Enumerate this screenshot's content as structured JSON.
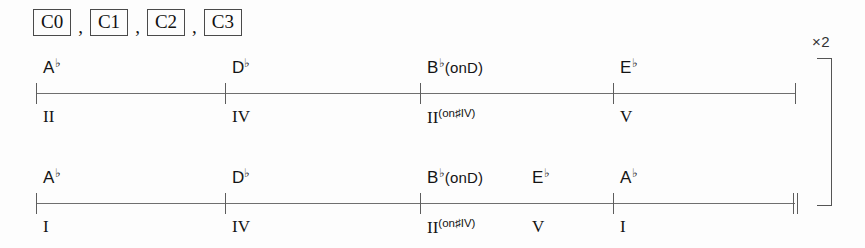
{
  "section_labels": {
    "separator": ",",
    "items": [
      "C0",
      "C1",
      "C2",
      "C3"
    ]
  },
  "repeat": {
    "count_label": "×2"
  },
  "chart_data": {
    "type": "table",
    "title": "",
    "key": "A♭ major",
    "sections": [
      "C0",
      "C1",
      "C2",
      "C3"
    ],
    "repeat_times": 2,
    "rows": [
      {
        "row_index": 1,
        "end_barline": "single",
        "events": [
          {
            "chord_root": "A",
            "chord_accidental": "♭",
            "chord_suffix": "",
            "chord_text": "A♭",
            "roman": "II",
            "roman_sup": "",
            "roman_text": "I",
            "x": 36,
            "tick": true
          },
          {
            "chord_root": "D",
            "chord_accidental": "♭",
            "chord_suffix": "",
            "chord_text": "D♭",
            "roman": "IV",
            "roman_sup": "",
            "roman_text": "IV",
            "x": 225,
            "tick": true
          },
          {
            "chord_root": "B",
            "chord_accidental": "♭",
            "chord_suffix": "(onD)",
            "chord_text": "B♭(onD)",
            "roman": "II",
            "roman_sup": "(on♯IV)",
            "roman_text": "II(on♯IV)",
            "x": 420,
            "tick": true
          },
          {
            "chord_root": "E",
            "chord_accidental": "♭",
            "chord_suffix": "",
            "chord_text": "E♭",
            "roman": "V",
            "roman_sup": "",
            "roman_text": "V",
            "x": 613,
            "tick": true
          }
        ]
      },
      {
        "row_index": 2,
        "end_barline": "double",
        "events": [
          {
            "chord_root": "A",
            "chord_accidental": "♭",
            "chord_suffix": "",
            "chord_text": "A♭",
            "roman": "I",
            "roman_sup": "",
            "roman_text": "I",
            "x": 36,
            "tick": true
          },
          {
            "chord_root": "D",
            "chord_accidental": "♭",
            "chord_suffix": "",
            "chord_text": "D♭",
            "roman": "IV",
            "roman_sup": "",
            "roman_text": "IV",
            "x": 225,
            "tick": true
          },
          {
            "chord_root": "B",
            "chord_accidental": "♭",
            "chord_suffix": "(onD)",
            "chord_text": "B♭(onD)",
            "roman": "II",
            "roman_sup": "(on♯IV)",
            "roman_text": "II(on♯IV)",
            "x": 420,
            "tick": true
          },
          {
            "chord_root": "E",
            "chord_accidental": "♭",
            "chord_suffix": "",
            "chord_text": "E♭",
            "roman": "V",
            "roman_sup": "",
            "roman_text": "V",
            "x": 525,
            "tick": false
          },
          {
            "chord_root": "A",
            "chord_accidental": "♭",
            "chord_suffix": "",
            "chord_text": "A♭",
            "roman": "I",
            "roman_sup": "",
            "roman_text": "I",
            "x": 613,
            "tick": true
          }
        ]
      }
    ]
  }
}
